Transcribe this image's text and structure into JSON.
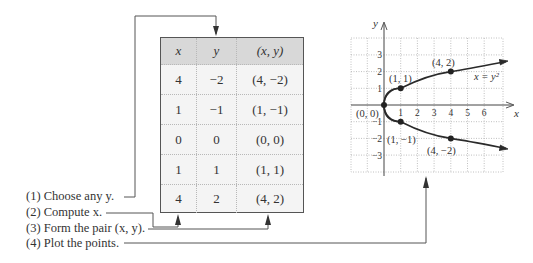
{
  "table": {
    "headers": [
      "x",
      "y",
      "(x, y)"
    ],
    "rows": [
      {
        "x": "4",
        "y": "−2",
        "pair": "(4, −2)"
      },
      {
        "x": "1",
        "y": "−1",
        "pair": "(1, −1)"
      },
      {
        "x": "0",
        "y": "0",
        "pair": "(0, 0)"
      },
      {
        "x": "1",
        "y": "1",
        "pair": "(1, 1)"
      },
      {
        "x": "4",
        "y": "2",
        "pair": "(4, 2)"
      }
    ]
  },
  "steps": [
    {
      "num": "(1)",
      "text": "Choose any y."
    },
    {
      "num": "(2)",
      "text": "Compute x."
    },
    {
      "num": "(3)",
      "text": "Form the pair (x, y)."
    },
    {
      "num": "(4)",
      "text": "Plot the points."
    }
  ],
  "graph": {
    "x_axis_label": "x",
    "y_axis_label": "y",
    "x_ticks": [
      "1",
      "2",
      "3",
      "4",
      "5",
      "6"
    ],
    "y_ticks": [
      "3",
      "2",
      "1",
      "−1",
      "−2",
      "−3"
    ],
    "equation": "x = y²",
    "points": [
      {
        "label": "(0, 0)",
        "x": 0,
        "y": 0
      },
      {
        "label": "(1, 1)",
        "x": 1,
        "y": 1
      },
      {
        "label": "(4, 2)",
        "x": 4,
        "y": 2
      },
      {
        "label": "(1, −1)",
        "x": 1,
        "y": -1
      },
      {
        "label": "(4, −2)",
        "x": 4,
        "y": -2
      }
    ]
  },
  "colors": {
    "header_bg": "#d8d8d8",
    "table_bg": "#f4f4f4",
    "line": "#555555",
    "grid": "#b0b0b0"
  }
}
